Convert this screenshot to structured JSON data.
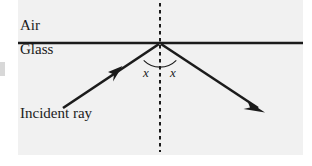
{
  "figure": {
    "background_color": "#ffffff",
    "panel_color": "#f1f1f1",
    "ink_color": "#1b1b1b",
    "labels": {
      "air": "Air",
      "glass": "Glass",
      "incident_ray": "Incident ray",
      "angle_of_incidence": "x",
      "angle_of_reflection": "x"
    },
    "elements": {
      "boundary_line": "air-glass-boundary",
      "normal_line": "dashed-normal",
      "incident_ray": "incident-ray-arrow",
      "reflected_ray": "reflected-ray-arrow",
      "angle_arc": "angle-arc"
    },
    "geometry": {
      "panel": {
        "x": 18,
        "y": 0,
        "width": 285,
        "height": 155
      },
      "boundary_y": 43,
      "vertex": {
        "x": 160,
        "y": 43
      },
      "normal_x": 160,
      "incident_start": {
        "x": 63,
        "y": 108
      },
      "reflected_end": {
        "x": 263,
        "y": 111
      },
      "arc_radius": 23
    }
  }
}
